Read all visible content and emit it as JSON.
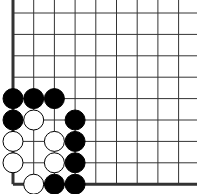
{
  "board": {
    "grid": {
      "x0": 13,
      "y0": 13,
      "spacing_x": 20.7,
      "spacing_y": 21.4,
      "cols": 10,
      "rows": 9
    },
    "edges": [
      "left",
      "bottom"
    ],
    "stones": [
      {
        "color": "black",
        "col": 0,
        "row": 4
      },
      {
        "color": "black",
        "col": 1,
        "row": 4
      },
      {
        "color": "black",
        "col": 2,
        "row": 4
      },
      {
        "color": "black",
        "col": 0,
        "row": 5
      },
      {
        "color": "white",
        "col": 1,
        "row": 5
      },
      {
        "color": "black",
        "col": 3,
        "row": 5
      },
      {
        "color": "white",
        "col": 0,
        "row": 6
      },
      {
        "color": "white",
        "col": 2,
        "row": 6
      },
      {
        "color": "black",
        "col": 3,
        "row": 6
      },
      {
        "color": "white",
        "col": 0,
        "row": 7
      },
      {
        "color": "white",
        "col": 2,
        "row": 7
      },
      {
        "color": "black",
        "col": 3,
        "row": 7
      },
      {
        "color": "white",
        "col": 1,
        "row": 8
      },
      {
        "color": "black",
        "col": 2,
        "row": 8
      },
      {
        "color": "black",
        "col": 3,
        "row": 8
      }
    ],
    "colors": {
      "line": "#333333",
      "black": "#000000",
      "white": "#ffffff"
    }
  }
}
